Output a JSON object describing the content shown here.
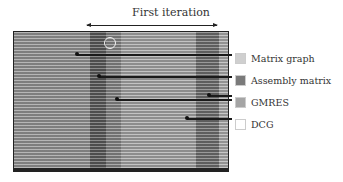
{
  "header": {
    "title": "First iteration"
  },
  "legend": {
    "items": [
      {
        "label": "Matrix graph",
        "color": "#cfcfcf"
      },
      {
        "label": "Assembly matrix",
        "color": "#7a7a7a"
      },
      {
        "label": "GMRES",
        "color": "#a5a5a5"
      },
      {
        "label": "DCG",
        "color": "#ffffff"
      }
    ]
  },
  "timeline": {
    "bands": [
      {
        "phase": "Matrix graph",
        "x": 0,
        "w": 76,
        "color": "#9a9a9a"
      },
      {
        "phase": "Assembly matrix",
        "x": 76,
        "w": 16,
        "color": "#5a5a5a"
      },
      {
        "phase": "GMRES",
        "x": 92,
        "w": 15,
        "color": "#8a8a8a"
      },
      {
        "phase": "DCG",
        "x": 107,
        "w": 75,
        "color": "#aaaaaa"
      },
      {
        "phase": "GMRES",
        "x": 182,
        "w": 23,
        "color": "#707070"
      },
      {
        "phase": "DCG",
        "x": 205,
        "w": 11,
        "color": "#b0b0b0"
      }
    ]
  }
}
